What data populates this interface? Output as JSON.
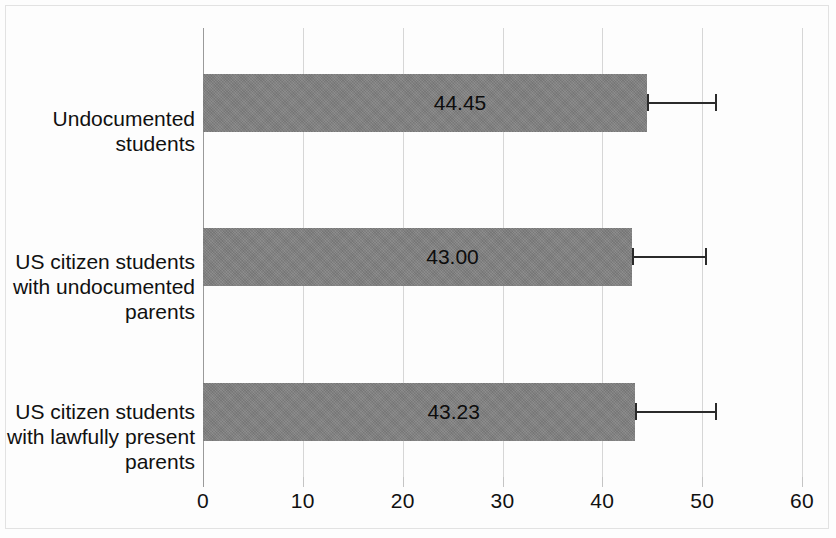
{
  "chart_data": {
    "type": "bar",
    "orientation": "horizontal",
    "title": "",
    "subtitle": "",
    "xlabel": "",
    "ylabel": "",
    "xlim": [
      0,
      60
    ],
    "xticks": [
      0,
      10,
      20,
      30,
      40,
      50,
      60
    ],
    "xtick_labels": [
      "0",
      "10",
      "20",
      "30",
      "40",
      "50",
      "60"
    ],
    "grid": true,
    "grid_axis": "x",
    "legend": false,
    "legend_position": "none",
    "bar_color": "#808080",
    "error_bar_color": "#2b2b2b",
    "gridline_color": "#d6d6d6",
    "categories": [
      "Undocumented students",
      "US citizen students with undocumented parents",
      "US citizen students with lawfully present parents"
    ],
    "category_lines": [
      [
        "Undocumented",
        "students"
      ],
      [
        "US citizen students",
        "with undocumented",
        "parents"
      ],
      [
        "US citizen students",
        "with lawfully present",
        "parents"
      ]
    ],
    "values": [
      44.45,
      43.0,
      43.23
    ],
    "value_labels": [
      "44.45",
      "43.00",
      "43.23"
    ],
    "error_high": [
      51.5,
      50.5,
      51.5
    ],
    "error_low": [
      44.45,
      43.0,
      43.23
    ]
  }
}
